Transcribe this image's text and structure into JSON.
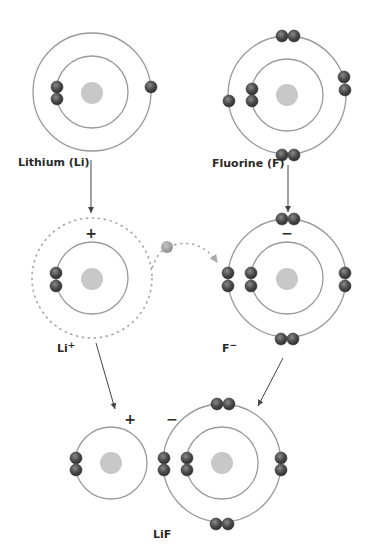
{
  "colors": {
    "electron": "#4a4a4a",
    "free_electron": "#a0a0a0",
    "nucleus": "#c8c8c8",
    "shell": "#9a9a9a",
    "arrow": "#444444"
  },
  "atoms": {
    "lithium": {
      "label": "Lithium (Li)",
      "inner_electrons": 2,
      "outer_electrons": 1
    },
    "fluorine": {
      "label": "Fluorine (F)",
      "inner_electrons": 2,
      "outer_electrons": 7
    }
  },
  "ions": {
    "lithium_ion": {
      "label": "Li",
      "charge_sup": "+",
      "sign": "+",
      "inner_electrons": 2,
      "outer_shell": "empty (dashed)"
    },
    "fluoride_ion": {
      "label": "F",
      "charge_sup": "−",
      "sign": "−",
      "inner_electrons": 2,
      "outer_electrons": 8
    }
  },
  "transfer": {
    "description": "one electron transferred from Li to F",
    "electron_icon": "electron-icon"
  },
  "compound": {
    "label": "LiF",
    "cation_sign": "+",
    "anion_sign": "−"
  }
}
